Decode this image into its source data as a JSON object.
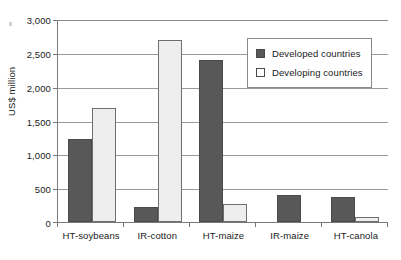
{
  "chart_data": {
    "type": "bar",
    "title": "",
    "xlabel": "",
    "ylabel": "US$ million",
    "ylim": [
      0,
      3000
    ],
    "ytick_values": [
      3000,
      2500,
      2000,
      1500,
      1000,
      500,
      0
    ],
    "ytick_labels": [
      "3,000",
      "2,500",
      "2,000",
      "1,500",
      "1,000",
      "500",
      "0"
    ],
    "grid": true,
    "legend_position": "upper-right-inside",
    "categories": [
      "HT-soybeans",
      "IR-cotton",
      "HT-maize",
      "IR-maize",
      "HT-canola"
    ],
    "series": [
      {
        "name": "Developed countries",
        "color": "#585858",
        "values": [
          1230,
          220,
          2390,
          405,
          365
        ]
      },
      {
        "name": "Developing countries",
        "color": "#eeeeee",
        "values": [
          1690,
          2690,
          265,
          0,
          75
        ]
      }
    ]
  }
}
